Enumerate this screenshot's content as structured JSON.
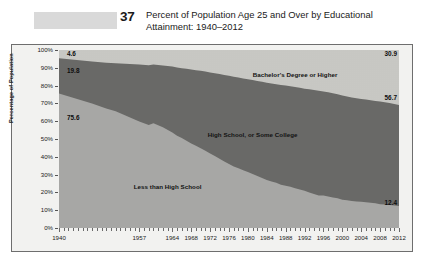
{
  "header": {
    "figure_number": "37",
    "title_line1": "Percent of Population Age 25 and Over by Educational",
    "title_line2": "Attainment: 1940–2012"
  },
  "chart_data": {
    "type": "area",
    "stacked": true,
    "title": "Percent of Population Age 25 and Over by Educational Attainment: 1940–2012",
    "xlabel": "",
    "ylabel": "Percentage of Population",
    "ylim": [
      0,
      100
    ],
    "xlim": [
      1940,
      2012
    ],
    "grid": false,
    "legend": "in-plot",
    "y_tick_labels": [
      "100%",
      "90%",
      "80%",
      "70%",
      "60%",
      "50%",
      "40%",
      "30%",
      "20%",
      "10%",
      "0%"
    ],
    "y_tick_values": [
      100,
      90,
      80,
      70,
      60,
      50,
      40,
      30,
      20,
      10,
      0
    ],
    "x_tick_labels": [
      "1940",
      "1957",
      "1964",
      "1968",
      "1972",
      "1976",
      "1980",
      "1984",
      "1988",
      "1992",
      "1996",
      "2000",
      "2004",
      "2008",
      "2012"
    ],
    "x_tick_values": [
      1940,
      1957,
      1964,
      1968,
      1972,
      1976,
      1980,
      1984,
      1988,
      1992,
      1996,
      2000,
      2004,
      2008,
      2012
    ],
    "series": [
      {
        "name": "Less than High School",
        "color": "#a8a8a6",
        "label_x": 1963,
        "label_y": 23,
        "start_value": 75.6,
        "end_value": 12.4,
        "x": [
          1940,
          1947,
          1950,
          1952,
          1957,
          1959,
          1960,
          1962,
          1964,
          1965,
          1966,
          1967,
          1968,
          1969,
          1970,
          1971,
          1972,
          1973,
          1974,
          1975,
          1976,
          1977,
          1978,
          1979,
          1980,
          1981,
          1982,
          1983,
          1984,
          1985,
          1986,
          1987,
          1988,
          1989,
          1990,
          1991,
          1992,
          1993,
          1994,
          1995,
          1996,
          1997,
          1998,
          1999,
          2000,
          2001,
          2002,
          2003,
          2004,
          2005,
          2006,
          2007,
          2008,
          2009,
          2010,
          2011,
          2012
        ],
        "values": [
          75.6,
          70.0,
          67.2,
          65.6,
          59.8,
          57.9,
          58.9,
          56.6,
          53.7,
          51.8,
          50.5,
          49.0,
          47.5,
          46.2,
          44.8,
          43.4,
          41.9,
          40.4,
          38.9,
          37.4,
          35.9,
          34.6,
          33.5,
          32.5,
          31.4,
          30.3,
          29.2,
          28.1,
          26.9,
          26.1,
          25.4,
          24.3,
          23.8,
          23.2,
          22.4,
          21.6,
          20.9,
          19.9,
          19.1,
          18.2,
          18.2,
          17.7,
          17.2,
          16.7,
          15.9,
          15.6,
          15.1,
          14.9,
          14.7,
          14.5,
          14.2,
          13.9,
          13.4,
          13.2,
          12.9,
          12.6,
          12.4
        ]
      },
      {
        "name": "High School, or Some College",
        "color": "#6a6a68",
        "label_x": 1981,
        "label_y": 52,
        "start_value": 19.8,
        "end_value": 56.7,
        "x": [
          1940,
          1947,
          1950,
          1952,
          1957,
          1959,
          1960,
          1962,
          1964,
          1965,
          1966,
          1967,
          1968,
          1969,
          1970,
          1971,
          1972,
          1973,
          1974,
          1975,
          1976,
          1977,
          1978,
          1979,
          1980,
          1981,
          1982,
          1983,
          1984,
          1985,
          1986,
          1987,
          1988,
          1989,
          1990,
          1991,
          1992,
          1993,
          1994,
          1995,
          1996,
          1997,
          1998,
          1999,
          2000,
          2001,
          2002,
          2003,
          2004,
          2005,
          2006,
          2007,
          2008,
          2009,
          2010,
          2011,
          2012
        ],
        "values": [
          19.8,
          23.5,
          25.6,
          27.0,
          32.0,
          33.5,
          32.9,
          34.7,
          37.0,
          38.3,
          39.3,
          40.4,
          41.5,
          42.4,
          43.5,
          44.5,
          45.5,
          46.5,
          47.6,
          48.6,
          49.6,
          50.4,
          51.0,
          51.5,
          52.2,
          52.8,
          53.4,
          54.0,
          54.7,
          55.1,
          55.4,
          56.0,
          56.2,
          56.4,
          56.8,
          57.2,
          57.4,
          58.0,
          58.4,
          58.9,
          58.5,
          58.5,
          58.5,
          58.4,
          58.5,
          58.3,
          58.2,
          58.0,
          57.8,
          57.7,
          57.6,
          57.5,
          57.6,
          57.5,
          57.3,
          57.0,
          56.7
        ]
      },
      {
        "name": "Bachelor's Degree or Higher",
        "color": "#c9c9c5",
        "label_x": 1990,
        "label_y": 86,
        "start_value": 4.6,
        "end_value": 30.9,
        "x": [
          1940,
          1947,
          1950,
          1952,
          1957,
          1959,
          1960,
          1962,
          1964,
          1965,
          1966,
          1967,
          1968,
          1969,
          1970,
          1971,
          1972,
          1973,
          1974,
          1975,
          1976,
          1977,
          1978,
          1979,
          1980,
          1981,
          1982,
          1983,
          1984,
          1985,
          1986,
          1987,
          1988,
          1989,
          1990,
          1991,
          1992,
          1993,
          1994,
          1995,
          1996,
          1997,
          1998,
          1999,
          2000,
          2001,
          2002,
          2003,
          2004,
          2005,
          2006,
          2007,
          2008,
          2009,
          2010,
          2011,
          2012
        ],
        "values": [
          4.6,
          6.5,
          7.2,
          7.4,
          8.2,
          8.6,
          8.2,
          8.7,
          9.3,
          9.9,
          10.2,
          10.6,
          11.0,
          11.4,
          11.7,
          12.1,
          12.6,
          13.1,
          13.5,
          14.0,
          14.5,
          15.0,
          15.5,
          16.0,
          16.4,
          16.9,
          17.4,
          17.9,
          18.4,
          18.8,
          19.2,
          19.7,
          20.0,
          20.4,
          20.8,
          21.2,
          21.7,
          22.1,
          22.5,
          22.9,
          23.3,
          23.8,
          24.3,
          24.9,
          25.6,
          26.1,
          26.7,
          27.1,
          27.5,
          27.8,
          28.2,
          28.6,
          29.0,
          29.3,
          29.8,
          30.4,
          30.9
        ]
      }
    ],
    "value_annotations": [
      {
        "text": "4.6",
        "x": 1940,
        "y": 97.5,
        "side": "left"
      },
      {
        "text": "19.8",
        "x": 1940,
        "y": 88.0,
        "side": "left"
      },
      {
        "text": "75.6",
        "x": 1940,
        "y": 62.0,
        "side": "left"
      },
      {
        "text": "30.9",
        "x": 2012,
        "y": 97.5,
        "side": "right"
      },
      {
        "text": "56.7",
        "x": 2012,
        "y": 73.0,
        "side": "right"
      },
      {
        "text": "12.4",
        "x": 2012,
        "y": 14.0,
        "side": "right"
      }
    ]
  }
}
